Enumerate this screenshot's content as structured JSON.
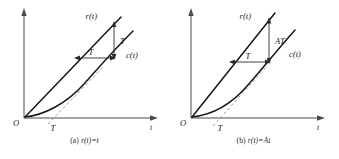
{
  "figure": {
    "background_color": "#ffffff",
    "line_color": "#171717",
    "axis_color": "#4a4a4a",
    "tangent_color": "#9a9a9a",
    "panels": [
      {
        "id": "a",
        "caption_prefix": "(a)",
        "caption_expression": "r(t)=t",
        "origin_label": "O",
        "x_axis_label": "t",
        "reference_label": "r(t)",
        "response_label": "c(t)",
        "x_tick_label": "T",
        "horizontal_dim_label": "T",
        "vertical_dim_label": "T"
      },
      {
        "id": "b",
        "caption_prefix": "(b)",
        "caption_expression": "r(t)=At",
        "origin_label": "O",
        "x_axis_label": "t",
        "reference_label": "r(t)",
        "response_label": "c(t)",
        "x_tick_label": "T",
        "horizontal_dim_label": "T",
        "vertical_dim_label": "AT"
      }
    ]
  }
}
